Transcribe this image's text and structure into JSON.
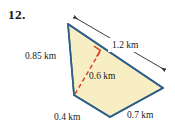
{
  "figure": {
    "problem_number": "12.",
    "shape_type": "quadrilateral",
    "unit": "km",
    "colors": {
      "fill": "#F7EFC3",
      "stroke": "#2E5F8A",
      "dashed_altitude": "#D6432B",
      "right_angle_marker": "#D6432B",
      "dimension_arrow": "#3A3A3A",
      "text": "#1a1a1a",
      "background": "#FFFFFF"
    },
    "vertices": {
      "top": [
        68,
        24
      ],
      "left": [
        74,
        95
      ],
      "bottom": [
        110,
        117
      ],
      "right": [
        163,
        88
      ]
    },
    "altitude": {
      "from": [
        75,
        94
      ],
      "to": [
        101,
        50
      ],
      "style": "dashed",
      "length_label": "0.6 km"
    },
    "right_angle_marker": {
      "at": [
        101,
        50
      ],
      "present": true
    },
    "dimension_arrow": {
      "from": [
        73,
        16
      ],
      "to": [
        166,
        71
      ],
      "double_headed": true,
      "measures": "1.2 km"
    },
    "labels": {
      "left_side": "0.85 km",
      "top_right_side": "1.2 km",
      "altitude": "0.6 km",
      "bottom_left_side": "0.4 km",
      "bottom_right_side": "0.7 km"
    }
  }
}
